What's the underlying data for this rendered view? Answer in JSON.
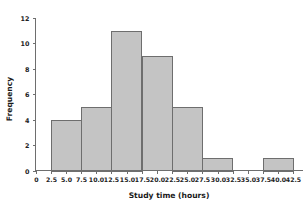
{
  "chart_data": {
    "type": "bar",
    "title": "",
    "subtitle": "",
    "xlabel": "Study time (hours)",
    "ylabel": "Frequency",
    "xlim": [
      0,
      43.5
    ],
    "ylim": [
      0,
      12
    ],
    "grid": false,
    "legend": null,
    "bin_width": 5,
    "bin_edges": [
      2.5,
      7.5,
      12.5,
      17.5,
      22.5,
      27.5,
      32.5,
      37.5,
      42.5
    ],
    "categories": [
      "2.5-7.5",
      "7.5-12.5",
      "12.5-17.5",
      "17.5-22.5",
      "22.5-27.5",
      "27.5-32.5",
      "32.5-37.5",
      "37.5-42.5"
    ],
    "values": [
      4,
      5,
      11,
      9,
      5,
      1,
      0,
      1
    ],
    "bars": [
      {
        "start": 2.5,
        "end": 7.5,
        "value": 4
      },
      {
        "start": 7.5,
        "end": 12.5,
        "value": 5
      },
      {
        "start": 12.5,
        "end": 17.5,
        "value": 11
      },
      {
        "start": 17.5,
        "end": 22.5,
        "value": 9
      },
      {
        "start": 22.5,
        "end": 27.5,
        "value": 5
      },
      {
        "start": 27.5,
        "end": 32.5,
        "value": 1
      },
      {
        "start": 32.5,
        "end": 37.5,
        "value": 0
      },
      {
        "start": 37.5,
        "end": 42.5,
        "value": 1
      }
    ],
    "xticks": [
      0,
      2.5,
      5.0,
      7.5,
      10.0,
      12.5,
      15.0,
      17.5,
      20.0,
      22.5,
      25.0,
      27.5,
      30.0,
      32.5,
      35.0,
      37.5,
      40.0,
      42.5
    ],
    "xticklabels": [
      "0",
      "2.5",
      "5.0",
      "7.5",
      "10.0",
      "12.5",
      "15.0",
      "17.5",
      "20.0",
      "22.5",
      "25.0",
      "27.5",
      "30.0",
      "32.5",
      "35.0",
      "37.5",
      "40.0",
      "42.5"
    ],
    "yticks": [
      0,
      2,
      4,
      6,
      8,
      10,
      12
    ],
    "yticklabels": [
      "0",
      "2",
      "4",
      "6",
      "8",
      "10",
      "12"
    ],
    "total_count": 36
  },
  "style": {
    "bar_fill": "#c4c4c4",
    "bar_edge": "#6e6e6e",
    "axis_color": "#6e6e6e",
    "text_color": "#222222",
    "background": "#ffffff"
  }
}
